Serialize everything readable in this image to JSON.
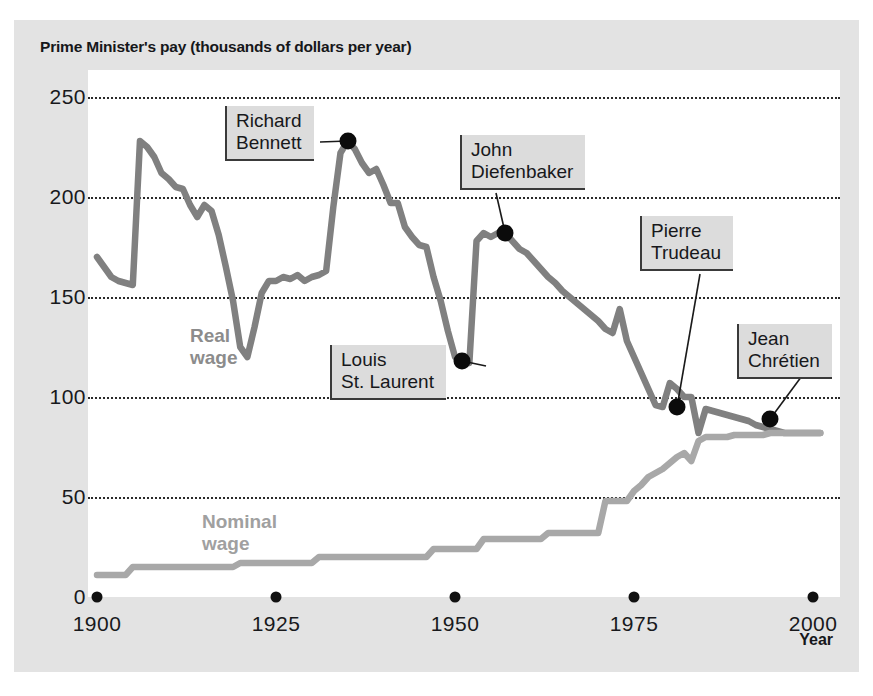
{
  "figure": {
    "title": "Prime Minister's pay (thousands of dollars per year)",
    "background_color": "#e3e3e3",
    "plot_background_color": "#ffffff"
  },
  "chart_data": {
    "type": "line",
    "title": "Prime Minister's pay (thousands of dollars per year)",
    "xlabel": "Year",
    "ylabel": "",
    "xlim": [
      1900,
      2002
    ],
    "ylim": [
      0,
      262
    ],
    "xticks": [
      1900,
      1925,
      1950,
      1975,
      2000
    ],
    "xticklabels": [
      "1900",
      "1925",
      "1950",
      "1975",
      "2000"
    ],
    "yticks": [
      0,
      50,
      100,
      150,
      200,
      250
    ],
    "yticklabels": [
      "0",
      "50",
      "100",
      "150",
      "200",
      "250"
    ],
    "grid": "horizontal-dotted",
    "legend": "inline-labels",
    "series": [
      {
        "name": "Real wage",
        "color": "#808080",
        "label_color": "#8c8c8c",
        "x": [
          1900,
          1901,
          1902,
          1903,
          1904,
          1905,
          1906,
          1907,
          1908,
          1909,
          1910,
          1911,
          1912,
          1913,
          1914,
          1915,
          1916,
          1917,
          1918,
          1919,
          1920,
          1921,
          1922,
          1923,
          1924,
          1925,
          1926,
          1927,
          1928,
          1929,
          1930,
          1931,
          1932,
          1933,
          1934,
          1935,
          1936,
          1937,
          1938,
          1939,
          1940,
          1941,
          1942,
          1943,
          1944,
          1945,
          1946,
          1947,
          1948,
          1949,
          1950,
          1951,
          1952,
          1953,
          1954,
          1955,
          1956,
          1957,
          1958,
          1959,
          1960,
          1961,
          1962,
          1963,
          1964,
          1965,
          1966,
          1967,
          1968,
          1969,
          1970,
          1971,
          1972,
          1973,
          1974,
          1975,
          1976,
          1977,
          1978,
          1979,
          1980,
          1981,
          1982,
          1983,
          1984,
          1985,
          1986,
          1987,
          1988,
          1989,
          1990,
          1991,
          1992,
          1993,
          1994,
          1995,
          1996,
          1997,
          1998,
          1999,
          2000,
          2001
        ],
        "y": [
          170,
          165,
          160,
          158,
          157,
          156,
          228,
          225,
          220,
          212,
          209,
          205,
          204,
          196,
          190,
          196,
          193,
          181,
          165,
          148,
          125,
          120,
          135,
          152,
          158,
          158,
          160,
          159,
          161,
          158,
          160,
          161,
          163,
          195,
          222,
          228,
          224,
          217,
          212,
          214,
          206,
          197,
          197,
          185,
          180,
          176,
          175,
          160,
          148,
          133,
          120,
          118,
          117,
          178,
          182,
          180,
          182,
          182,
          178,
          174,
          172,
          168,
          164,
          160,
          157,
          153,
          150,
          147,
          144,
          141,
          138,
          134,
          132,
          144,
          128,
          120,
          112,
          104,
          96,
          95,
          107,
          104,
          100,
          100,
          82,
          94,
          93,
          92,
          91,
          90,
          89,
          88,
          86,
          85,
          84,
          83,
          82,
          82,
          82,
          82,
          82,
          82
        ]
      },
      {
        "name": "Nominal wage",
        "color": "#a8a8a8",
        "label_color": "#a0a0a0",
        "x": [
          1900,
          1904,
          1905,
          1919,
          1920,
          1930,
          1931,
          1946,
          1947,
          1953,
          1954,
          1962,
          1963,
          1970,
          1971,
          1974,
          1975,
          1976,
          1977,
          1978,
          1979,
          1980,
          1981,
          1982,
          1983,
          1984,
          1985,
          1986,
          1987,
          1988,
          1989,
          1990,
          1991,
          1992,
          1993,
          1994,
          1995,
          1996,
          1997,
          1998,
          1999,
          2000,
          2001
        ],
        "y": [
          11,
          11,
          15,
          15,
          17,
          17,
          20,
          20,
          24,
          24,
          29,
          29,
          32,
          32,
          48,
          48,
          53,
          56,
          60,
          62,
          64,
          67,
          70,
          72,
          68,
          78,
          80,
          80,
          80,
          80,
          81,
          81,
          81,
          81,
          81,
          82,
          82,
          82,
          82,
          82,
          82,
          82,
          82
        ]
      }
    ],
    "annotations": [
      {
        "label": "Richard\nBennett",
        "name": "Richard Bennett",
        "year": 1935,
        "value": 228
      },
      {
        "label": "Louis\nSt. Laurent",
        "name": "Louis St. Laurent",
        "year": 1951,
        "value": 118
      },
      {
        "label": "John\nDiefenbaker",
        "name": "John Diefenbaker",
        "year": 1957,
        "value": 182
      },
      {
        "label": "Pierre\nTrudeau",
        "name": "Pierre Trudeau",
        "year": 1981,
        "value": 95
      },
      {
        "label": "Jean\nChrétien",
        "name": "Jean Chrétien",
        "year": 1994,
        "value": 89
      }
    ]
  },
  "axis": {
    "x_title": "Year",
    "y_ticks": [
      {
        "label": "250",
        "value": 250
      },
      {
        "label": "200",
        "value": 200
      },
      {
        "label": "150",
        "value": 150
      },
      {
        "label": "100",
        "value": 100
      },
      {
        "label": "50",
        "value": 50
      },
      {
        "label": "0",
        "value": 0
      }
    ],
    "x_ticks": [
      {
        "label": "1900",
        "value": 1900
      },
      {
        "label": "1925",
        "value": 1925
      },
      {
        "label": "1950",
        "value": 1950
      },
      {
        "label": "1975",
        "value": 1975
      },
      {
        "label": "2000",
        "value": 2000
      }
    ]
  },
  "series_labels": {
    "real": {
      "line1": "Real",
      "line2": "wage"
    },
    "nominal": {
      "line1": "Nominal",
      "line2": "wage"
    }
  },
  "callouts": {
    "bennett": {
      "line1": "Richard",
      "line2": "Bennett"
    },
    "stlaurent": {
      "line1": "Louis",
      "line2": "St. Laurent"
    },
    "diefenbaker": {
      "line1": "John",
      "line2": "Diefenbaker"
    },
    "trudeau": {
      "line1": "Pierre",
      "line2": "Trudeau"
    },
    "chretien": {
      "line1": "Jean",
      "line2": "Chrétien"
    }
  }
}
